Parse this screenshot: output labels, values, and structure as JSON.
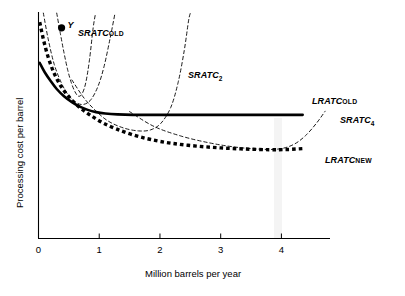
{
  "chart_data": {
    "type": "line",
    "title": "",
    "xlabel": "Million barrels per year",
    "ylabel": "Processing cost per barrel",
    "xlim": [
      0,
      4.8
    ],
    "ylim": [
      0,
      1
    ],
    "xticks": [
      "0",
      "1",
      "2",
      "3",
      "4"
    ],
    "xtick_values": [
      0,
      1,
      2,
      3,
      4
    ],
    "yticks": [],
    "grid": false,
    "legend_position": "inline-annotations",
    "annotations": [
      {
        "name": "point-y",
        "label": "Y",
        "x": 0.38,
        "y": 0.93,
        "marker": "filled-circle"
      }
    ],
    "series": [
      {
        "name": "LRATC_OLD",
        "label_main": "LRATC",
        "label_sub": "OLD",
        "style": "solid-thick",
        "color": "#000000",
        "points": [
          [
            0.02,
            0.775
          ],
          [
            0.1,
            0.735
          ],
          [
            0.2,
            0.695
          ],
          [
            0.3,
            0.66
          ],
          [
            0.42,
            0.628
          ],
          [
            0.55,
            0.602
          ],
          [
            0.68,
            0.582
          ],
          [
            0.8,
            0.569
          ],
          [
            0.95,
            0.558
          ],
          [
            1.1,
            0.552
          ],
          [
            1.3,
            0.548
          ],
          [
            1.55,
            0.546
          ],
          [
            1.9,
            0.546
          ],
          [
            2.4,
            0.546
          ],
          [
            3.0,
            0.546
          ],
          [
            3.6,
            0.546
          ],
          [
            4.1,
            0.546
          ],
          [
            4.35,
            0.546
          ]
        ]
      },
      {
        "name": "LRATC_NEW",
        "label_main": "LRATC",
        "label_sub": "NEW",
        "style": "dotted-thick",
        "color": "#000000",
        "points": [
          [
            0.02,
            0.955
          ],
          [
            0.08,
            0.88
          ],
          [
            0.16,
            0.8
          ],
          [
            0.26,
            0.728
          ],
          [
            0.38,
            0.668
          ],
          [
            0.52,
            0.62
          ],
          [
            0.68,
            0.578
          ],
          [
            0.85,
            0.545
          ],
          [
            1.05,
            0.512
          ],
          [
            1.28,
            0.484
          ],
          [
            1.55,
            0.458
          ],
          [
            1.85,
            0.437
          ],
          [
            2.2,
            0.42
          ],
          [
            2.6,
            0.408
          ],
          [
            3.0,
            0.4
          ],
          [
            3.4,
            0.395
          ],
          [
            3.8,
            0.392
          ],
          [
            4.1,
            0.393
          ],
          [
            4.35,
            0.397
          ]
        ]
      },
      {
        "name": "SRATC_OLD",
        "label_main": "SRATC",
        "label_sub": "OLD",
        "style": "dashed-thin",
        "color": "#000000",
        "points": [
          [
            0.3,
            0.995
          ],
          [
            0.36,
            0.905
          ],
          [
            0.42,
            0.82
          ],
          [
            0.48,
            0.745
          ],
          [
            0.54,
            0.688
          ],
          [
            0.6,
            0.648
          ],
          [
            0.66,
            0.628
          ],
          [
            0.72,
            0.64
          ],
          [
            0.78,
            0.69
          ],
          [
            0.84,
            0.79
          ],
          [
            0.9,
            0.93
          ],
          [
            0.94,
            0.995
          ]
        ]
      },
      {
        "name": "SRATC_1",
        "label_main": "",
        "label_sub": "",
        "style": "dashed-thin",
        "color": "#000000",
        "points": [
          [
            0.08,
            0.995
          ],
          [
            0.16,
            0.88
          ],
          [
            0.26,
            0.768
          ],
          [
            0.38,
            0.685
          ],
          [
            0.5,
            0.63
          ],
          [
            0.62,
            0.6
          ],
          [
            0.74,
            0.592
          ],
          [
            0.86,
            0.612
          ],
          [
            0.98,
            0.672
          ],
          [
            1.08,
            0.76
          ],
          [
            1.18,
            0.885
          ],
          [
            1.26,
            0.995
          ]
        ]
      },
      {
        "name": "SRATC_2",
        "label_main": "SRATC",
        "label_sub": "2",
        "style": "dashed-thin",
        "color": "#000000",
        "points": [
          [
            0.55,
            0.7
          ],
          [
            0.75,
            0.62
          ],
          [
            0.95,
            0.562
          ],
          [
            1.15,
            0.518
          ],
          [
            1.4,
            0.488
          ],
          [
            1.65,
            0.475
          ],
          [
            1.85,
            0.48
          ],
          [
            2.02,
            0.51
          ],
          [
            2.18,
            0.58
          ],
          [
            2.3,
            0.69
          ],
          [
            2.4,
            0.83
          ],
          [
            2.47,
            0.96
          ],
          [
            2.5,
            0.995
          ]
        ]
      },
      {
        "name": "SRATC_4",
        "label_main": "SRATC",
        "label_sub": "4",
        "style": "dashed-thin",
        "color": "#000000",
        "points": [
          [
            1.5,
            0.56
          ],
          [
            1.9,
            0.495
          ],
          [
            2.35,
            0.452
          ],
          [
            2.8,
            0.423
          ],
          [
            3.2,
            0.405
          ],
          [
            3.6,
            0.395
          ],
          [
            3.95,
            0.395
          ],
          [
            4.2,
            0.415
          ],
          [
            4.4,
            0.455
          ],
          [
            4.58,
            0.51
          ],
          [
            4.72,
            0.562
          ]
        ]
      }
    ]
  },
  "axes": {
    "x_title": "Million barrels per year",
    "y_title": "Processing cost per barrel",
    "x_tick_labels": [
      "0",
      "1",
      "2",
      "3",
      "4"
    ]
  },
  "labels": {
    "sratc_old": {
      "main": "SRATC",
      "sub": "OLD"
    },
    "sratc_2": {
      "main": "SRATC",
      "sub": "2"
    },
    "sratc_4": {
      "main": "SRATC",
      "sub": "4"
    },
    "lratc_old": {
      "main": "LRATC",
      "sub": "OLD"
    },
    "lratc_new": {
      "main": "LRATC",
      "sub": "NEW"
    },
    "point_y": "Y"
  },
  "colors": {
    "background": "#ffffff",
    "axis": "#000000",
    "curve": "#000000",
    "marker_band": "#f2f2f2"
  }
}
